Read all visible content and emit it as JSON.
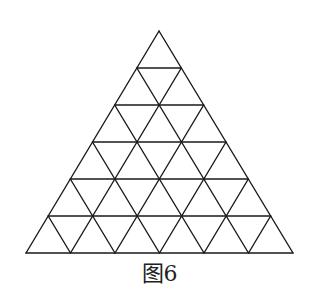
{
  "figure": {
    "caption": "图6",
    "rows": 6,
    "apex": [
      159,
      31
    ],
    "base_left": [
      26,
      253
    ],
    "base_right": [
      293,
      253
    ],
    "stroke_color": "#1a1a1a",
    "stroke_width": 1.4
  }
}
